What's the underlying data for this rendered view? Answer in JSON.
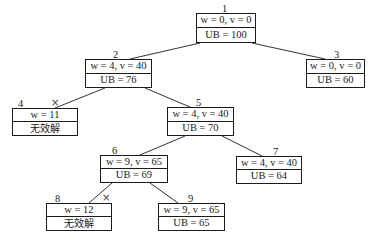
{
  "diagram": {
    "type": "branch-and-bound-tree",
    "nodes": [
      {
        "id": "1",
        "top": "w = 0, v = 0",
        "bottom": "UB = 100",
        "pruned": false
      },
      {
        "id": "2",
        "top": "w = 4, v = 40",
        "bottom": "UB = 76",
        "pruned": false
      },
      {
        "id": "3",
        "top": "w = 0, v = 0",
        "bottom": "UB = 60",
        "pruned": false
      },
      {
        "id": "4",
        "top": "w = 11",
        "bottom": "无效解",
        "pruned": true,
        "prune_mark": "×"
      },
      {
        "id": "5",
        "top": "w = 4, v = 40",
        "bottom": "UB = 70",
        "pruned": false
      },
      {
        "id": "6",
        "top": "w = 9, v = 65",
        "bottom": "UB = 69",
        "pruned": false
      },
      {
        "id": "7",
        "top": "w = 4, v = 40",
        "bottom": "UB = 64",
        "pruned": false
      },
      {
        "id": "8",
        "top": "w = 12",
        "bottom": "无效解",
        "pruned": true,
        "prune_mark": "×"
      },
      {
        "id": "9",
        "top": "w = 9, v = 65",
        "bottom": "UB = 65",
        "pruned": false
      }
    ],
    "edges": [
      {
        "from": "1",
        "to": "2"
      },
      {
        "from": "1",
        "to": "3"
      },
      {
        "from": "2",
        "to": "4"
      },
      {
        "from": "2",
        "to": "5"
      },
      {
        "from": "5",
        "to": "6"
      },
      {
        "from": "5",
        "to": "7"
      },
      {
        "from": "6",
        "to": "8"
      },
      {
        "from": "6",
        "to": "9"
      }
    ]
  }
}
